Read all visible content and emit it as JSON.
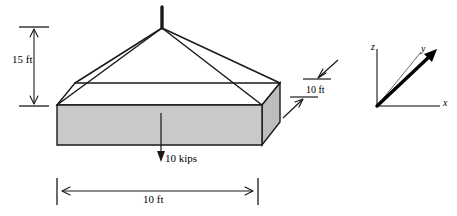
{
  "figure": {
    "type": "engineering-free-body-diagram",
    "colors": {
      "line": "#1a1a1a",
      "slab_front_face": "#c9c9c9",
      "slab_right_face": "#bdbdbd",
      "slab_top_face": "#ffffff",
      "background": "#ffffff"
    },
    "dimensions": {
      "cable_height": "15 ft",
      "slab_width": "10 ft",
      "slab_depth": "10 ft"
    },
    "load": {
      "magnitude": "10 kips",
      "direction": "downward"
    },
    "axes": {
      "z_label": "z",
      "y_label": "y",
      "x_label": "x"
    }
  }
}
